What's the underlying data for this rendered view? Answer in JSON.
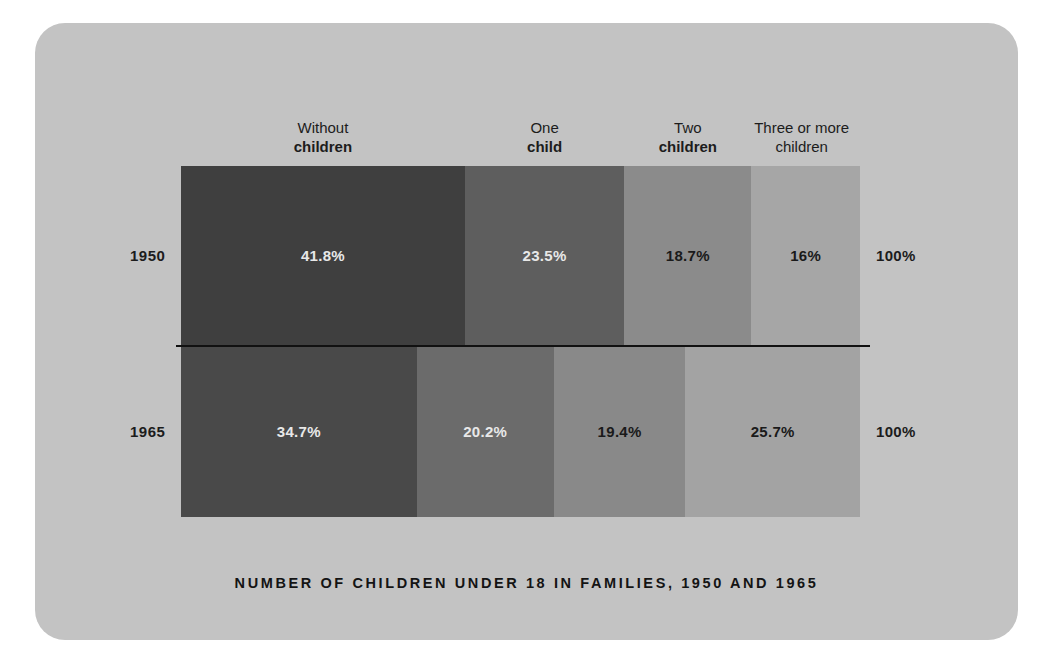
{
  "card": {
    "background_color": "#c3c3c3"
  },
  "chart_data": {
    "type": "bar",
    "subtype": "stacked-horizontal-100-percent",
    "title": "NUMBER OF CHILDREN UNDER 18 IN FAMILIES, 1950 AND 1965",
    "xlabel": "",
    "ylabel": "",
    "grid": false,
    "legend_position": "top-as-column-headers",
    "axis_range": [
      0,
      100
    ],
    "units": "percent",
    "categories": [
      "1950",
      "1965"
    ],
    "series": [
      {
        "name": "Without children",
        "name_line1": "Without",
        "name_line2": "children",
        "color": "#3f3f3f",
        "values": [
          41.8,
          34.7
        ],
        "value_labels": [
          "41.8%",
          "23.5%"
        ]
      },
      {
        "name": "One child",
        "name_line1": "One",
        "name_line2": "child",
        "color": "#5e5e5e",
        "values": [
          23.5,
          20.2
        ]
      },
      {
        "name": "Two children",
        "name_line1": "Two",
        "name_line2": "children",
        "color": "#8b8b8b",
        "values": [
          18.7,
          19.4
        ]
      },
      {
        "name": "Three or more children",
        "name_line1": "Three or more",
        "name_line2": "children",
        "color": "#a6a6a6",
        "values": [
          16.0,
          25.7
        ]
      }
    ],
    "row_totals": [
      "100%",
      "100%"
    ]
  },
  "headers": [
    {
      "line1": "Without",
      "line2": "children",
      "bold_line2": true
    },
    {
      "line1": "One",
      "line2": "child",
      "bold_line2": true
    },
    {
      "line1": "Two",
      "line2": "children",
      "bold_line2": true
    },
    {
      "line1": "Three or more",
      "line2": "children",
      "bold_line2": false
    }
  ],
  "rows": [
    {
      "year": "1950",
      "total": "100%",
      "segments": [
        {
          "label": "41.8%",
          "value": 41.8,
          "color": "#3f3f3f",
          "text_tone": "light"
        },
        {
          "label": "23.5%",
          "value": 23.5,
          "color": "#5e5e5e",
          "text_tone": "light"
        },
        {
          "label": "18.7%",
          "value": 18.7,
          "color": "#8b8b8b",
          "text_tone": "dark"
        },
        {
          "label": "16%",
          "value": 16.0,
          "color": "#a6a6a6",
          "text_tone": "dark"
        }
      ]
    },
    {
      "year": "1965",
      "total": "100%",
      "segments": [
        {
          "label": "34.7%",
          "value": 34.7,
          "color": "#494949",
          "text_tone": "light"
        },
        {
          "label": "20.2%",
          "value": 20.2,
          "color": "#6b6b6b",
          "text_tone": "light"
        },
        {
          "label": "19.4%",
          "value": 19.4,
          "color": "#898989",
          "text_tone": "dark"
        },
        {
          "label": "25.7%",
          "value": 25.7,
          "color": "#a3a3a3",
          "text_tone": "dark"
        }
      ]
    }
  ],
  "title": {
    "text": "NUMBER OF CHILDREN UNDER 18 IN FAMILIES, 1950 AND 1965"
  }
}
